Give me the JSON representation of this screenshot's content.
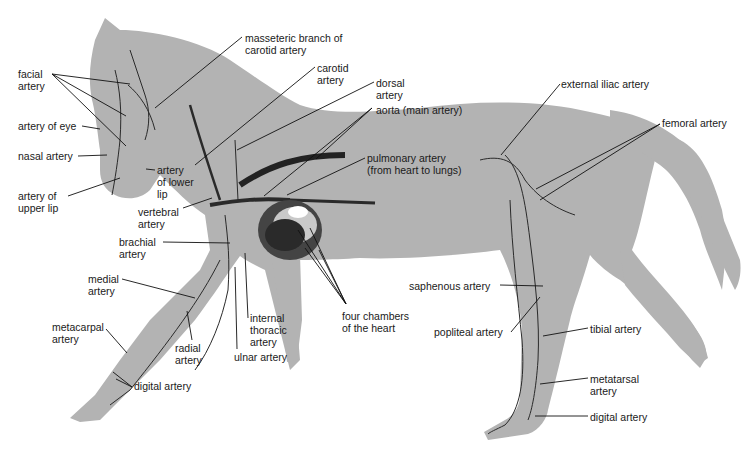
{
  "diagram": {
    "colors": {
      "body": "#b3b3b3",
      "vessel": "#2a2a2a",
      "leader": "#111111",
      "text": "#1a1a1a"
    },
    "labels": [
      {
        "id": "facial",
        "text": "facial\nartery",
        "x": 18,
        "y": 68
      },
      {
        "id": "eye",
        "text": "artery of eye",
        "x": 18,
        "y": 120
      },
      {
        "id": "nasal",
        "text": "nasal artery",
        "x": 18,
        "y": 150
      },
      {
        "id": "upperlip",
        "text": "artery of\nupper lip",
        "x": 18,
        "y": 190
      },
      {
        "id": "lowerlip",
        "text": "artery\nof lower\nlip",
        "x": 157,
        "y": 164
      },
      {
        "id": "masseteric",
        "text": "masseteric branch of\ncarotid artery",
        "x": 245,
        "y": 32
      },
      {
        "id": "carotid",
        "text": "carotid\nartery",
        "x": 317,
        "y": 62
      },
      {
        "id": "dorsal",
        "text": "dorsal\nartery",
        "x": 376,
        "y": 77
      },
      {
        "id": "aorta",
        "text": "aorta (main artery)",
        "x": 376,
        "y": 104
      },
      {
        "id": "pulmonary",
        "text": "pulmonary artery\n(from heart to lungs)",
        "x": 367,
        "y": 152
      },
      {
        "id": "vertebral",
        "text": "vertebral\nartery",
        "x": 138,
        "y": 206
      },
      {
        "id": "brachial",
        "text": "brachial\nartery",
        "x": 119,
        "y": 236
      },
      {
        "id": "medial",
        "text": "medial\nartery",
        "x": 88,
        "y": 273
      },
      {
        "id": "metacarpal",
        "text": "metacarpal\nartery",
        "x": 52,
        "y": 321
      },
      {
        "id": "radial",
        "text": "radial\nartery",
        "x": 175,
        "y": 342
      },
      {
        "id": "internalthoracic",
        "text": "internal\nthoracic\nartery",
        "x": 250,
        "y": 312
      },
      {
        "id": "ulnar",
        "text": "ulnar artery",
        "x": 234,
        "y": 351
      },
      {
        "id": "digitalfore",
        "text": "digital artery",
        "x": 134,
        "y": 380
      },
      {
        "id": "fourchambers",
        "text": "four chambers\nof the heart",
        "x": 342,
        "y": 310
      },
      {
        "id": "externaliliac",
        "text": "external iliac artery",
        "x": 561,
        "y": 78
      },
      {
        "id": "femoral",
        "text": "femoral artery",
        "x": 662,
        "y": 117
      },
      {
        "id": "saphenous",
        "text": "saphenous artery",
        "x": 409,
        "y": 280
      },
      {
        "id": "popliteal",
        "text": "popliteal artery",
        "x": 434,
        "y": 326
      },
      {
        "id": "tibial",
        "text": "tibial artery",
        "x": 590,
        "y": 323
      },
      {
        "id": "metatarsal",
        "text": "metatarsal\nartery",
        "x": 590,
        "y": 373
      },
      {
        "id": "digitalhind",
        "text": "digital artery",
        "x": 590,
        "y": 411
      }
    ]
  }
}
